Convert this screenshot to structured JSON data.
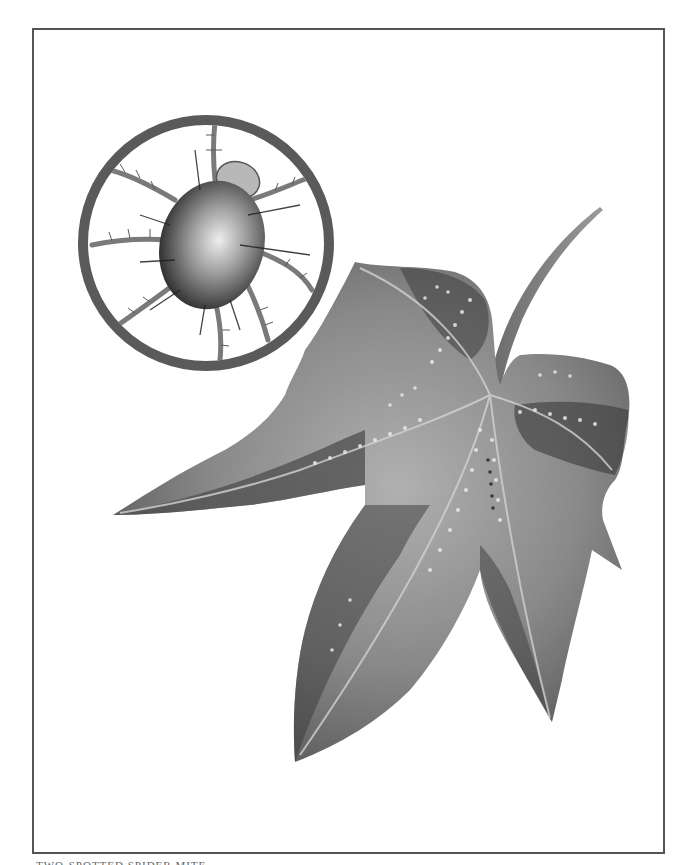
{
  "figure": {
    "caption_visible": "partially cut off at bottom edge",
    "caption_text": "TWO-SPOTTED SPIDER MITE"
  },
  "colors": {
    "background": "#ffffff",
    "frame_border": "#555555",
    "inset_ring": "#5a5a5a",
    "leaf_dark": "#4a4a4a",
    "leaf_mid": "#8a8a8a",
    "leaf_light": "#c4c4c4",
    "mite_body_dark": "#2e2e2e",
    "mite_body_light": "#e6e6e6",
    "spots": "#e8e8e8"
  },
  "inset": {
    "shape": "circle",
    "center_x": 206,
    "center_y": 243,
    "radius": 123,
    "ring_width": 10
  }
}
